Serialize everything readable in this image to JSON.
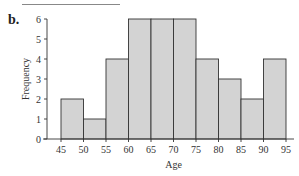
{
  "header": {
    "partial_text": "",
    "part_label": "b."
  },
  "chart_data": {
    "type": "bar",
    "subtype": "histogram",
    "title": "",
    "xlabel": "Age",
    "ylabel": "Frequency",
    "bin_edges": [
      45,
      50,
      55,
      60,
      65,
      70,
      75,
      80,
      85,
      90,
      95
    ],
    "categories": [
      "45-50",
      "50-55",
      "55-60",
      "60-65",
      "65-70",
      "70-75",
      "75-80",
      "80-85",
      "85-90",
      "90-95"
    ],
    "values": [
      2,
      1,
      4,
      6,
      6,
      6,
      4,
      3,
      2,
      4
    ],
    "xticks": [
      "45",
      "50",
      "55",
      "60",
      "65",
      "70",
      "75",
      "80",
      "85",
      "90",
      "95"
    ],
    "yticks": [
      "0",
      "1",
      "2",
      "3",
      "4",
      "5",
      "6"
    ],
    "xlim": [
      45,
      95
    ],
    "ylim": [
      0,
      6
    ],
    "grid": false,
    "legend": "none",
    "bar_color": "#d3d3d3",
    "edge_color": "#333333"
  }
}
